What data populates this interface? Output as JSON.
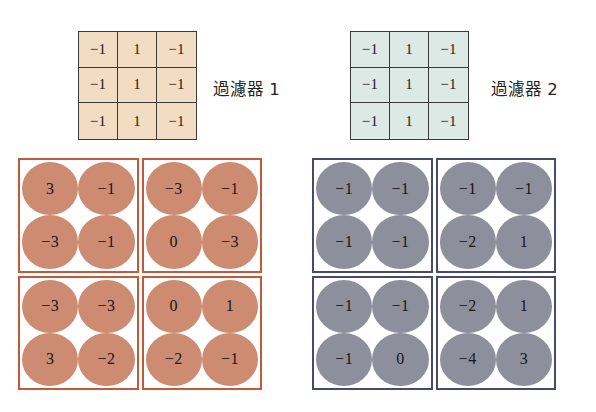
{
  "filters": [
    {
      "id": "filter-1",
      "label": "過濾器 1",
      "background_color": "#f2ddc2",
      "border_color": "#3b3a38",
      "rows": [
        [
          "−1",
          "1",
          "−1"
        ],
        [
          "−1",
          "1",
          "−1"
        ],
        [
          "−1",
          "1",
          "−1"
        ]
      ]
    },
    {
      "id": "filter-2",
      "label": "過濾器 2",
      "background_color": "#dde9e5",
      "border_color": "#3b3a38",
      "rows": [
        [
          "−1",
          "1",
          "−1"
        ],
        [
          "−1",
          "1",
          "−1"
        ],
        [
          "−1",
          "1",
          "−1"
        ]
      ]
    }
  ],
  "feature_map_groups": [
    {
      "id": "group-orange",
      "disc_color": "#cd8c71",
      "border_color": "#c4583b",
      "blocks": [
        {
          "position": "top-left",
          "values": [
            "3",
            "−1",
            "−3",
            "−1"
          ]
        },
        {
          "position": "top-right",
          "values": [
            "−3",
            "−1",
            "0",
            "−3"
          ]
        },
        {
          "position": "bottom-left",
          "values": [
            "−3",
            "−3",
            "3",
            "−2"
          ]
        },
        {
          "position": "bottom-right",
          "values": [
            "0",
            "1",
            "−2",
            "−1"
          ]
        }
      ]
    },
    {
      "id": "group-blue",
      "disc_color": "#8d8f9d",
      "border_color": "#474b6b",
      "blocks": [
        {
          "position": "top-left",
          "values": [
            "−1",
            "−1",
            "−1",
            "−1"
          ]
        },
        {
          "position": "top-right",
          "values": [
            "−1",
            "−1",
            "−2",
            "1"
          ]
        },
        {
          "position": "bottom-left",
          "values": [
            "−1",
            "−1",
            "−1",
            "0"
          ]
        },
        {
          "position": "bottom-right",
          "values": [
            "−2",
            "1",
            "−4",
            "3"
          ]
        }
      ]
    }
  ]
}
